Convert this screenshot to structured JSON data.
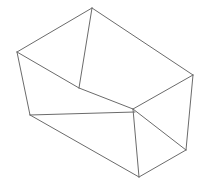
{
  "figure": {
    "background_color": "#ffffff",
    "stroke_color": "#6b6b6b",
    "stroke_width": 1,
    "canvas": {
      "width": 203,
      "height": 190
    }
  },
  "chart_data": {
    "type": "line",
    "xlabel": "",
    "ylabel": "",
    "xlim": [
      0,
      203
    ],
    "ylim": [
      0,
      190
    ],
    "grid": false,
    "legend": "none",
    "vertices": {
      "A": [
        17,
        52
      ],
      "B": [
        92,
        8
      ],
      "C": [
        193,
        75
      ],
      "D": [
        79,
        88
      ],
      "E": [
        133,
        109
      ],
      "F": [
        30,
        115
      ],
      "G": [
        186,
        150
      ],
      "H": [
        139,
        177
      ]
    },
    "vertex_labels": {
      "A": "top-left-rim",
      "B": "top-back-rim",
      "C": "top-right-rim",
      "D": "inner-front-left-corner",
      "E": "inner-front-right-corner",
      "F": "bottom-left-corner",
      "G": "bottom-right-corner",
      "H": "bottom-front-corner"
    },
    "edges": [
      {
        "name": "rim-back-left",
        "from": "A",
        "to": "B",
        "points": [
          [
            17,
            52
          ],
          [
            92,
            8
          ]
        ]
      },
      {
        "name": "rim-back-right",
        "from": "B",
        "to": "C",
        "points": [
          [
            92,
            8
          ],
          [
            193,
            75
          ]
        ]
      },
      {
        "name": "inner-vertical-front",
        "from": "B",
        "to": "D",
        "points": [
          [
            92,
            8
          ],
          [
            79,
            88
          ]
        ]
      },
      {
        "name": "inner-diagonal-left",
        "from": "A",
        "to": "D",
        "points": [
          [
            17,
            52
          ],
          [
            79,
            88
          ]
        ]
      },
      {
        "name": "left-wall-vertical",
        "from": "A",
        "to": "F",
        "points": [
          [
            17,
            52
          ],
          [
            30,
            115
          ]
        ]
      },
      {
        "name": "inner-floor-left",
        "from": "D",
        "to": "E",
        "points": [
          [
            79,
            88
          ],
          [
            133,
            109
          ]
        ]
      },
      {
        "name": "floor-front-left",
        "from": "F",
        "to": "E",
        "points": [
          [
            30,
            115
          ],
          [
            135,
            112
          ]
        ]
      },
      {
        "name": "inner-floor-right",
        "from": "E",
        "to": "C",
        "points": [
          [
            133,
            109
          ],
          [
            193,
            75
          ]
        ]
      },
      {
        "name": "right-wall-vertical",
        "from": "C",
        "to": "G",
        "points": [
          [
            193,
            75
          ],
          [
            186,
            150
          ]
        ]
      },
      {
        "name": "floor-right-edge",
        "from": "E",
        "to": "G",
        "points": [
          [
            133,
            109
          ],
          [
            186,
            150
          ]
        ]
      },
      {
        "name": "front-vertical",
        "from": "E",
        "to": "H",
        "points": [
          [
            133,
            109
          ],
          [
            139,
            177
          ]
        ]
      },
      {
        "name": "front-face-left",
        "from": "F",
        "to": "H",
        "points": [
          [
            30,
            115
          ],
          [
            139,
            177
          ]
        ]
      },
      {
        "name": "front-face-right",
        "from": "H",
        "to": "G",
        "points": [
          [
            139,
            177
          ],
          [
            186,
            150
          ]
        ]
      }
    ]
  }
}
